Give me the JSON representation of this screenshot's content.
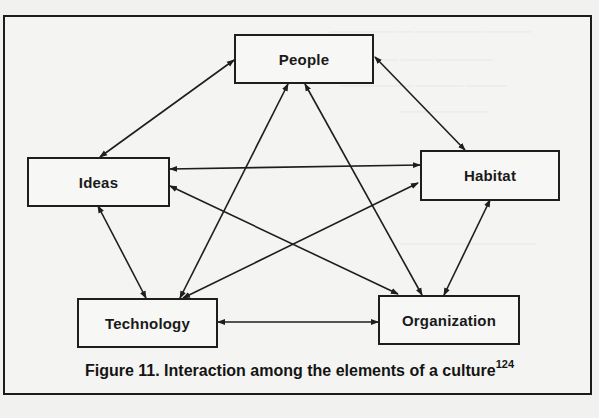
{
  "figure": {
    "caption": "Figure 11. Interaction among the elements of a culture",
    "caption_superscript": "124",
    "colors": {
      "line": "#1e1e1e",
      "background": "#f2f2f0",
      "box_fill": "#f7f7f5"
    }
  },
  "nodes": {
    "people": {
      "label": "People"
    },
    "ideas": {
      "label": "Ideas"
    },
    "habitat": {
      "label": "Habitat"
    },
    "technology": {
      "label": "Technology"
    },
    "organization": {
      "label": "Organization"
    }
  },
  "edges": [
    {
      "from": "Ideas",
      "to": "People",
      "direction": "both"
    },
    {
      "from": "People",
      "to": "Habitat",
      "direction": "both"
    },
    {
      "from": "People",
      "to": "Technology",
      "direction": "both"
    },
    {
      "from": "People",
      "to": "Organization",
      "direction": "both"
    },
    {
      "from": "Ideas",
      "to": "Habitat",
      "direction": "both"
    },
    {
      "from": "Ideas",
      "to": "Technology",
      "direction": "both"
    },
    {
      "from": "Ideas",
      "to": "Organization",
      "direction": "both"
    },
    {
      "from": "Habitat",
      "to": "Technology",
      "direction": "both"
    },
    {
      "from": "Habitat",
      "to": "Organization",
      "direction": "both"
    },
    {
      "from": "Technology",
      "to": "Organization",
      "direction": "both"
    }
  ]
}
